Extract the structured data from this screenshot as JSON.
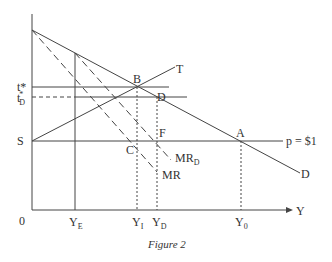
{
  "figure": {
    "caption": "Figure 2",
    "line_color": "#444444",
    "axes": {
      "origin_label": "0",
      "x_axis_label": "Y"
    },
    "price_axis_labels": {
      "t_star": "t*",
      "t_D_star_main": "t",
      "t_D_star_sup": "*",
      "t_D_star_sub": "D",
      "S": "S"
    },
    "quantity_axis_labels": {
      "Y_E_main": "Y",
      "Y_E_sub": "E",
      "Y_I_main": "Y",
      "Y_I_sub": "I",
      "Y_D_main": "Y",
      "Y_D_sub": "D",
      "Y_0_main": "Y",
      "Y_0_sub": "0"
    },
    "point_labels": {
      "A": "A",
      "B": "B",
      "C": "C",
      "D": "D",
      "F": "F"
    },
    "curve_labels": {
      "T": "T",
      "D": "D",
      "price_line": "p = $1",
      "MR": "MR",
      "MR_D_main": "MR",
      "MR_D_sub": "D"
    }
  }
}
